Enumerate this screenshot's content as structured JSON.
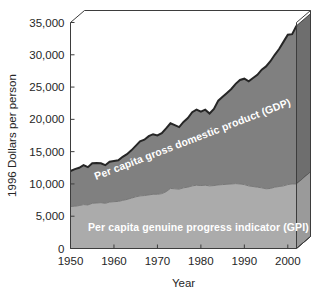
{
  "chart_data": {
    "type": "area",
    "title": "",
    "xlabel": "Year",
    "ylabel": "1996 Dollars per person",
    "stacked": true,
    "grid": false,
    "legend_position": "inline-labels",
    "xlim": [
      1950,
      2002
    ],
    "ylim": [
      0,
      35000
    ],
    "xticks": [
      1950,
      1960,
      1970,
      1980,
      1990,
      2000
    ],
    "xtick_labels": [
      "1950",
      "1960",
      "1970",
      "1980",
      "1990",
      "2000"
    ],
    "yticks": [
      0,
      5000,
      10000,
      15000,
      20000,
      25000,
      30000,
      35000
    ],
    "ytick_labels": [
      "0",
      "5,000",
      "10,000",
      "15,000",
      "20,000",
      "25,000",
      "30,000",
      "35,000"
    ],
    "x": [
      1950,
      1951,
      1952,
      1953,
      1954,
      1955,
      1956,
      1957,
      1958,
      1959,
      1960,
      1961,
      1962,
      1963,
      1964,
      1965,
      1966,
      1967,
      1968,
      1969,
      1970,
      1971,
      1972,
      1973,
      1974,
      1975,
      1976,
      1977,
      1978,
      1979,
      1980,
      1981,
      1982,
      1983,
      1984,
      1985,
      1986,
      1987,
      1988,
      1989,
      1990,
      1991,
      1992,
      1993,
      1994,
      1995,
      1996,
      1997,
      1998,
      1999,
      2000,
      2001,
      2002
    ],
    "series": [
      {
        "name": "Per capita genuine progress indicator (GPI)",
        "key": "gpi",
        "color": "#ababab",
        "label_color": "#ffffff",
        "values": [
          6500,
          6550,
          6650,
          6800,
          6750,
          7000,
          7050,
          7100,
          7000,
          7200,
          7250,
          7300,
          7450,
          7600,
          7800,
          8000,
          8150,
          8200,
          8300,
          8400,
          8400,
          8500,
          8800,
          9300,
          9250,
          9200,
          9400,
          9500,
          9700,
          9800,
          9750,
          9800,
          9700,
          9750,
          9850,
          9900,
          9950,
          10000,
          10050,
          10000,
          9900,
          9700,
          9600,
          9500,
          9400,
          9250,
          9300,
          9500,
          9600,
          9700,
          9900,
          10000,
          10000
        ]
      },
      {
        "name": "Per capita gross domestic product (GDP)",
        "key": "gdp",
        "color": "#808080",
        "outline_color": "#262626",
        "label_color": "#ffffff",
        "values": [
          12000,
          12300,
          12500,
          12900,
          12600,
          13200,
          13250,
          13200,
          12900,
          13450,
          13550,
          13650,
          14200,
          14600,
          15200,
          15900,
          16600,
          16850,
          17400,
          17700,
          17500,
          17850,
          18600,
          19400,
          19100,
          18800,
          19600,
          20200,
          21100,
          21500,
          21200,
          21500,
          20900,
          21600,
          22900,
          23500,
          24100,
          24700,
          25500,
          26100,
          26300,
          25900,
          26400,
          26900,
          27700,
          28200,
          29000,
          30000,
          30900,
          32000,
          33100,
          33200,
          34500
        ]
      }
    ],
    "annotations": [
      {
        "name": "gdp-band-label",
        "text": "Per capita gross domestic product (GDP)",
        "rotation": -21
      },
      {
        "name": "gpi-band-label",
        "text": "Per capita genuine progress indicator (GPI)",
        "rotation": 0
      }
    ]
  },
  "axes": {
    "y_title": "1996 Dollars per person",
    "x_title": "Year"
  },
  "colors": {
    "background": "#ffffff",
    "gdp_fill": "#808080",
    "gpi_fill": "#ababab",
    "side_face_gdp": "#6e6e6e",
    "side_face_gpi": "#9a9a9a",
    "top_face": "#ffffff",
    "axis": "#3d3d3d",
    "outline": "#262626",
    "label_text": "#ffffff",
    "tick_text": "#262626"
  }
}
